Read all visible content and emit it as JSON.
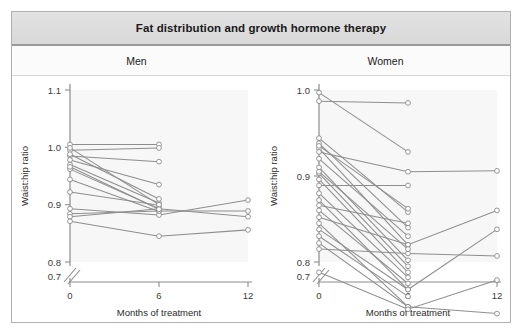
{
  "figure": {
    "title": "Fat distribution and growth hormone therapy"
  },
  "panels": [
    {
      "label": "Men"
    },
    {
      "label": "Women"
    }
  ],
  "chart_data": [
    {
      "type": "line",
      "title": "Men",
      "xlabel": "Months of treatment",
      "ylabel": "Waist:hip ratio",
      "x": [
        0,
        6,
        12
      ],
      "x_tick_labels": [
        "0",
        "6",
        "12"
      ],
      "y_tick_labels": [
        "0.7",
        "0.8",
        "0.9",
        "1.0",
        "1.1"
      ],
      "y_ticks": [
        0.7,
        0.8,
        0.9,
        1.0,
        1.1
      ],
      "ylim": [
        0.7,
        1.1
      ],
      "xlim": [
        0,
        12
      ],
      "axis_break": true,
      "grid": false,
      "legend": "none",
      "marker": "open-circle",
      "series": [
        {
          "name": "subject-1",
          "values": [
            1.005,
            1.005,
            null
          ]
        },
        {
          "name": "subject-2",
          "values": [
            0.995,
            0.999,
            null
          ]
        },
        {
          "name": "subject-3",
          "values": [
            0.985,
            0.975,
            null
          ]
        },
        {
          "name": "subject-4",
          "values": [
            0.978,
            0.935,
            null
          ]
        },
        {
          "name": "subject-5",
          "values": [
            0.97,
            0.903,
            null
          ]
        },
        {
          "name": "subject-6",
          "values": [
            0.962,
            0.893,
            null
          ]
        },
        {
          "name": "subject-7",
          "values": [
            0.944,
            0.888,
            null
          ]
        },
        {
          "name": "subject-8",
          "values": [
            0.922,
            0.899,
            null
          ]
        },
        {
          "name": "subject-9",
          "values": [
            0.893,
            0.882,
            0.908
          ]
        },
        {
          "name": "subject-10",
          "values": [
            0.884,
            0.889,
            0.889
          ]
        },
        {
          "name": "subject-11",
          "values": [
            0.879,
            0.893,
            0.879
          ]
        },
        {
          "name": "subject-12",
          "values": [
            0.871,
            0.845,
            0.856
          ]
        },
        {
          "name": "subject-13",
          "values": [
            0.999,
            0.9,
            null
          ]
        },
        {
          "name": "subject-14",
          "values": [
            0.988,
            0.91,
            null
          ]
        },
        {
          "name": "subject-15",
          "values": [
            0.966,
            0.892,
            null
          ]
        }
      ]
    },
    {
      "type": "line",
      "title": "Women",
      "xlabel": "Months of treatment",
      "ylabel": "Waist:hip ratio",
      "x": [
        0,
        6,
        12
      ],
      "x_tick_labels": [
        "0",
        "6",
        "12"
      ],
      "y_tick_labels": [
        "0.7",
        "0.8",
        "0.9",
        "1.0"
      ],
      "y_ticks": [
        0.7,
        0.8,
        0.9,
        1.0
      ],
      "ylim": [
        0.7,
        1.0
      ],
      "xlim": [
        0,
        12
      ],
      "axis_break": true,
      "grid": false,
      "legend": "none",
      "marker": "open-circle",
      "series": [
        {
          "name": "subject-1",
          "values": [
            0.997,
            0.928,
            null
          ]
        },
        {
          "name": "subject-2",
          "values": [
            0.987,
            0.985,
            null
          ]
        },
        {
          "name": "subject-3",
          "values": [
            0.944,
            0.858,
            null
          ]
        },
        {
          "name": "subject-4",
          "values": [
            0.938,
            0.84,
            null
          ]
        },
        {
          "name": "subject-5",
          "values": [
            0.932,
            0.82,
            null
          ]
        },
        {
          "name": "subject-6",
          "values": [
            0.928,
            0.905,
            0.906
          ]
        },
        {
          "name": "subject-7",
          "values": [
            0.91,
            0.802,
            null
          ]
        },
        {
          "name": "subject-8",
          "values": [
            0.903,
            0.795,
            null
          ]
        },
        {
          "name": "subject-9",
          "values": [
            0.896,
            0.788,
            null
          ]
        },
        {
          "name": "subject-10",
          "values": [
            0.889,
            0.889,
            null
          ]
        },
        {
          "name": "subject-11",
          "values": [
            0.88,
            0.782,
            null
          ]
        },
        {
          "name": "subject-12",
          "values": [
            0.872,
            0.768,
            null
          ]
        },
        {
          "name": "subject-13",
          "values": [
            0.866,
            0.845,
            null
          ]
        },
        {
          "name": "subject-14",
          "values": [
            0.86,
            0.775,
            null
          ]
        },
        {
          "name": "subject-15",
          "values": [
            0.852,
            0.82,
            0.86
          ]
        },
        {
          "name": "subject-16",
          "values": [
            0.845,
            0.748,
            null
          ]
        },
        {
          "name": "subject-17",
          "values": [
            0.838,
            0.768,
            0.838
          ]
        },
        {
          "name": "subject-18",
          "values": [
            0.83,
            0.76,
            null
          ]
        },
        {
          "name": "subject-19",
          "values": [
            0.822,
            0.748,
            0.74
          ]
        },
        {
          "name": "subject-20",
          "values": [
            0.815,
            0.81,
            0.807
          ]
        },
        {
          "name": "subject-21",
          "values": [
            0.788,
            0.745,
            0.779
          ]
        },
        {
          "name": "subject-22",
          "values": [
            0.935,
            0.862,
            null
          ]
        },
        {
          "name": "subject-23",
          "values": [
            0.92,
            0.83,
            null
          ]
        },
        {
          "name": "subject-24",
          "values": [
            0.905,
            0.815,
            null
          ]
        }
      ]
    }
  ]
}
